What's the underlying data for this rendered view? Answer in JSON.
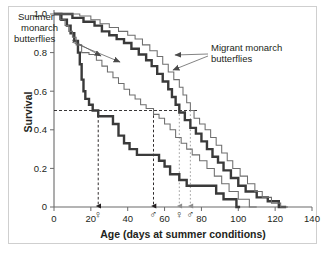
{
  "figure": {
    "background_color": "#ffffff",
    "frame_color": "#cfcfcf"
  },
  "chart_data": {
    "type": "line",
    "subtype": "kaplan-meier-survival-step",
    "title": "",
    "xlabel": "Age (days at summer conditions)",
    "ylabel": "Survival",
    "xlim": [
      0,
      140
    ],
    "ylim": [
      0,
      1.0
    ],
    "xticks": [
      0,
      20,
      40,
      60,
      80,
      100,
      120,
      140
    ],
    "xtick_labels": [
      "0",
      "20",
      "40",
      "60",
      "80",
      "100",
      "120",
      "140"
    ],
    "yticks": [
      0,
      0.2,
      0.4,
      0.6,
      0.8,
      1.0
    ],
    "ytick_labels": [
      "0",
      "0.2",
      "0.4",
      "0.6",
      "0.8",
      "1.0"
    ],
    "grid": false,
    "legend_position": "annotations",
    "line_color_thick": "#3a3a3a",
    "line_color_thin": "#6e6e6e",
    "reference_line_value": 0.5,
    "reference_line_style": "dashed",
    "series": [
      {
        "name": "Summer monarch butterflies — female",
        "group": "summer",
        "sex": "female",
        "style": "thick",
        "color": "#3a3a3a",
        "median_survival_days": 24,
        "points": [
          [
            0,
            1.0
          ],
          [
            4,
            1.0
          ],
          [
            4,
            0.97
          ],
          [
            7,
            0.97
          ],
          [
            7,
            0.94
          ],
          [
            9,
            0.94
          ],
          [
            9,
            0.9
          ],
          [
            11,
            0.9
          ],
          [
            11,
            0.86
          ],
          [
            13,
            0.86
          ],
          [
            13,
            0.8
          ],
          [
            14,
            0.8
          ],
          [
            14,
            0.74
          ],
          [
            15,
            0.74
          ],
          [
            15,
            0.66
          ],
          [
            16,
            0.66
          ],
          [
            16,
            0.6
          ],
          [
            17,
            0.6
          ],
          [
            17,
            0.56
          ],
          [
            19,
            0.56
          ],
          [
            19,
            0.53
          ],
          [
            21,
            0.53
          ],
          [
            21,
            0.5
          ],
          [
            24,
            0.5
          ],
          [
            24,
            0.47
          ],
          [
            32,
            0.47
          ],
          [
            32,
            0.43
          ],
          [
            35,
            0.43
          ],
          [
            35,
            0.37
          ],
          [
            38,
            0.37
          ],
          [
            38,
            0.33
          ],
          [
            41,
            0.33
          ],
          [
            41,
            0.3
          ],
          [
            45,
            0.3
          ],
          [
            45,
            0.27
          ],
          [
            57,
            0.27
          ],
          [
            57,
            0.24
          ],
          [
            60,
            0.24
          ],
          [
            60,
            0.21
          ],
          [
            63,
            0.21
          ],
          [
            63,
            0.17
          ],
          [
            68,
            0.17
          ],
          [
            68,
            0.14
          ],
          [
            72,
            0.14
          ],
          [
            72,
            0.11
          ],
          [
            88,
            0.11
          ],
          [
            88,
            0.07
          ],
          [
            92,
            0.07
          ],
          [
            92,
            0.04
          ],
          [
            99,
            0.04
          ],
          [
            99,
            0.0
          ],
          [
            101,
            0.0
          ]
        ]
      },
      {
        "name": "Summer monarch butterflies — male",
        "group": "summer",
        "sex": "male",
        "style": "thin",
        "color": "#6e6e6e",
        "median_survival_days": 54,
        "points": [
          [
            0,
            1.0
          ],
          [
            3,
            1.0
          ],
          [
            3,
            0.97
          ],
          [
            6,
            0.97
          ],
          [
            6,
            0.94
          ],
          [
            8,
            0.94
          ],
          [
            8,
            0.91
          ],
          [
            10,
            0.91
          ],
          [
            10,
            0.88
          ],
          [
            12,
            0.88
          ],
          [
            12,
            0.84
          ],
          [
            15,
            0.84
          ],
          [
            15,
            0.8
          ],
          [
            19,
            0.8
          ],
          [
            19,
            0.79
          ],
          [
            23,
            0.79
          ],
          [
            23,
            0.76
          ],
          [
            26,
            0.76
          ],
          [
            26,
            0.73
          ],
          [
            29,
            0.73
          ],
          [
            29,
            0.7
          ],
          [
            32,
            0.7
          ],
          [
            32,
            0.67
          ],
          [
            35,
            0.67
          ],
          [
            35,
            0.64
          ],
          [
            38,
            0.64
          ],
          [
            38,
            0.61
          ],
          [
            41,
            0.61
          ],
          [
            41,
            0.58
          ],
          [
            44,
            0.58
          ],
          [
            44,
            0.56
          ],
          [
            47,
            0.56
          ],
          [
            47,
            0.53
          ],
          [
            50,
            0.53
          ],
          [
            50,
            0.51
          ],
          [
            54,
            0.51
          ],
          [
            54,
            0.48
          ],
          [
            57,
            0.48
          ],
          [
            57,
            0.46
          ],
          [
            60,
            0.46
          ],
          [
            60,
            0.43
          ],
          [
            63,
            0.43
          ],
          [
            63,
            0.4
          ],
          [
            66,
            0.4
          ],
          [
            66,
            0.36
          ],
          [
            69,
            0.36
          ],
          [
            69,
            0.33
          ],
          [
            72,
            0.33
          ],
          [
            72,
            0.3
          ],
          [
            75,
            0.3
          ],
          [
            75,
            0.27
          ],
          [
            79,
            0.27
          ],
          [
            79,
            0.24
          ],
          [
            83,
            0.24
          ],
          [
            83,
            0.2
          ],
          [
            87,
            0.2
          ],
          [
            87,
            0.16
          ],
          [
            91,
            0.16
          ],
          [
            91,
            0.12
          ],
          [
            95,
            0.12
          ],
          [
            95,
            0.08
          ],
          [
            100,
            0.08
          ],
          [
            100,
            0.04
          ],
          [
            106,
            0.04
          ],
          [
            106,
            0.0
          ],
          [
            110,
            0.0
          ]
        ]
      },
      {
        "name": "Migrant monarch butterflies — female",
        "group": "migrant",
        "sex": "female",
        "style": "thick",
        "color": "#3a3a3a",
        "median_survival_days": 68,
        "points": [
          [
            0,
            1.0
          ],
          [
            10,
            1.0
          ],
          [
            10,
            0.98
          ],
          [
            16,
            0.98
          ],
          [
            16,
            0.96
          ],
          [
            22,
            0.96
          ],
          [
            22,
            0.94
          ],
          [
            26,
            0.94
          ],
          [
            26,
            0.91
          ],
          [
            30,
            0.91
          ],
          [
            30,
            0.89
          ],
          [
            34,
            0.89
          ],
          [
            34,
            0.87
          ],
          [
            38,
            0.87
          ],
          [
            38,
            0.85
          ],
          [
            42,
            0.85
          ],
          [
            42,
            0.82
          ],
          [
            46,
            0.82
          ],
          [
            46,
            0.79
          ],
          [
            50,
            0.79
          ],
          [
            50,
            0.76
          ],
          [
            53,
            0.76
          ],
          [
            53,
            0.73
          ],
          [
            56,
            0.73
          ],
          [
            56,
            0.69
          ],
          [
            59,
            0.69
          ],
          [
            59,
            0.65
          ],
          [
            62,
            0.65
          ],
          [
            62,
            0.61
          ],
          [
            64,
            0.61
          ],
          [
            64,
            0.57
          ],
          [
            66,
            0.57
          ],
          [
            66,
            0.53
          ],
          [
            68,
            0.53
          ],
          [
            68,
            0.49
          ],
          [
            71,
            0.49
          ],
          [
            71,
            0.45
          ],
          [
            74,
            0.45
          ],
          [
            74,
            0.41
          ],
          [
            77,
            0.41
          ],
          [
            77,
            0.38
          ],
          [
            80,
            0.38
          ],
          [
            80,
            0.34
          ],
          [
            83,
            0.34
          ],
          [
            83,
            0.3
          ],
          [
            86,
            0.3
          ],
          [
            86,
            0.26
          ],
          [
            89,
            0.26
          ],
          [
            89,
            0.23
          ],
          [
            92,
            0.23
          ],
          [
            92,
            0.19
          ],
          [
            96,
            0.19
          ],
          [
            96,
            0.15
          ],
          [
            100,
            0.15
          ],
          [
            100,
            0.11
          ],
          [
            104,
            0.11
          ],
          [
            104,
            0.08
          ],
          [
            110,
            0.08
          ],
          [
            110,
            0.05
          ],
          [
            116,
            0.05
          ],
          [
            116,
            0.03
          ],
          [
            122,
            0.03
          ],
          [
            122,
            0.0
          ],
          [
            126,
            0.0
          ]
        ]
      },
      {
        "name": "Migrant monarch butterflies — male",
        "group": "migrant",
        "sex": "male",
        "style": "thin",
        "color": "#6e6e6e",
        "median_survival_days": 74,
        "points": [
          [
            0,
            1.0
          ],
          [
            14,
            1.0
          ],
          [
            14,
            0.99
          ],
          [
            20,
            0.99
          ],
          [
            20,
            0.97
          ],
          [
            25,
            0.97
          ],
          [
            25,
            0.95
          ],
          [
            30,
            0.95
          ],
          [
            30,
            0.93
          ],
          [
            35,
            0.93
          ],
          [
            35,
            0.91
          ],
          [
            40,
            0.91
          ],
          [
            40,
            0.89
          ],
          [
            44,
            0.89
          ],
          [
            44,
            0.87
          ],
          [
            48,
            0.87
          ],
          [
            48,
            0.84
          ],
          [
            52,
            0.84
          ],
          [
            52,
            0.81
          ],
          [
            56,
            0.81
          ],
          [
            56,
            0.78
          ],
          [
            59,
            0.78
          ],
          [
            59,
            0.74
          ],
          [
            62,
            0.74
          ],
          [
            62,
            0.7
          ],
          [
            65,
            0.7
          ],
          [
            65,
            0.66
          ],
          [
            68,
            0.66
          ],
          [
            68,
            0.62
          ],
          [
            70,
            0.62
          ],
          [
            70,
            0.58
          ],
          [
            72,
            0.58
          ],
          [
            72,
            0.54
          ],
          [
            74,
            0.54
          ],
          [
            74,
            0.5
          ],
          [
            76,
            0.5
          ],
          [
            76,
            0.46
          ],
          [
            79,
            0.46
          ],
          [
            79,
            0.43
          ],
          [
            82,
            0.43
          ],
          [
            82,
            0.4
          ],
          [
            85,
            0.4
          ],
          [
            85,
            0.36
          ],
          [
            88,
            0.36
          ],
          [
            88,
            0.32
          ],
          [
            91,
            0.32
          ],
          [
            91,
            0.28
          ],
          [
            94,
            0.28
          ],
          [
            94,
            0.24
          ],
          [
            97,
            0.24
          ],
          [
            97,
            0.2
          ],
          [
            101,
            0.2
          ],
          [
            101,
            0.16
          ],
          [
            105,
            0.16
          ],
          [
            105,
            0.12
          ],
          [
            109,
            0.12
          ],
          [
            109,
            0.08
          ],
          [
            113,
            0.08
          ],
          [
            113,
            0.05
          ],
          [
            118,
            0.05
          ],
          [
            118,
            0.02
          ],
          [
            123,
            0.02
          ],
          [
            123,
            0.0
          ],
          [
            127,
            0.0
          ]
        ]
      }
    ],
    "median_markers": [
      {
        "label": "summer-female-median",
        "symbol": "♀",
        "x": 24,
        "arrow_color": "#231f20",
        "arrow_style": "dashed",
        "group": "summer"
      },
      {
        "label": "summer-male-median",
        "symbol": "♂",
        "x": 54,
        "arrow_color": "#231f20",
        "arrow_style": "dashed",
        "group": "summer"
      },
      {
        "label": "migrant-female-median",
        "symbol": "♀",
        "x": 68,
        "arrow_color": "#9a9a9a",
        "arrow_style": "dotted",
        "group": "migrant"
      },
      {
        "label": "migrant-male-median",
        "symbol": "♂",
        "x": 74,
        "arrow_color": "#9a9a9a",
        "arrow_style": "dotted",
        "group": "migrant"
      }
    ],
    "annotations": [
      {
        "id": "summer-label",
        "text_lines": [
          "Summer",
          "monarch",
          "butterflies"
        ],
        "position": "upper-left"
      },
      {
        "id": "migrant-label",
        "text_lines": [
          "Migrant monarch",
          "butterflies"
        ],
        "position": "upper-right"
      }
    ]
  }
}
